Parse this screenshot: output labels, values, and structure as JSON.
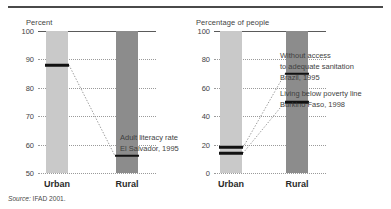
{
  "source_note": {
    "prefix": "Source:",
    "text": " IFAD 2001."
  },
  "colors": {
    "urban_bar": "#c9c9c9",
    "rural_bar": "#8c8c8c",
    "marker": "#111111",
    "gridline": "#9a9a9a",
    "text": "#3f3f3f"
  },
  "chart_data": [
    {
      "id": "left",
      "type": "bar",
      "title": "",
      "ylabel": "Percent",
      "xlabel": "",
      "categories": [
        "Urban",
        "Rural"
      ],
      "ylim": [
        50,
        100
      ],
      "yticks": [
        50,
        60,
        70,
        80,
        90,
        100
      ],
      "grid": true,
      "legend": "none",
      "series": [
        {
          "name": "Adult literacy rate El Salvador, 1995",
          "values": [
            88,
            56
          ],
          "annotation_lines": [
            "Adult literacy rate",
            "El Salvador, 1995"
          ]
        }
      ]
    },
    {
      "id": "right",
      "type": "bar",
      "title": "",
      "ylabel": "Percentage of people",
      "xlabel": "",
      "categories": [
        "Urban",
        "Rural"
      ],
      "ylim": [
        0,
        100
      ],
      "yticks": [
        0,
        20,
        40,
        60,
        80,
        100
      ],
      "grid": true,
      "legend": "none",
      "series": [
        {
          "name": "Without access to adequate sanitation Brazil, 1995",
          "values": [
            18,
            70
          ],
          "annotation_lines": [
            "Without access",
            "to adequate sanitation",
            "Brazil, 1995"
          ]
        },
        {
          "name": "Living below poverty line Burkino Faso, 1998",
          "values": [
            14,
            50
          ],
          "annotation_lines": [
            "Living below poverty line",
            "Burkino Faso, 1998"
          ]
        }
      ]
    }
  ]
}
